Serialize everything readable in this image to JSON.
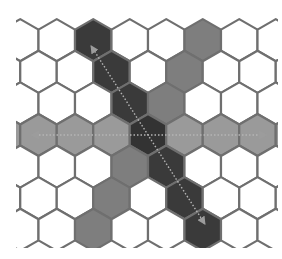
{
  "diagram": {
    "grid": {
      "orientation": "pointy-top",
      "rows": [
        -3,
        -2,
        -1,
        0,
        1,
        2,
        3
      ],
      "q_range": [
        -6,
        6
      ]
    },
    "center_cell": {
      "q": 0,
      "r": 0
    },
    "axes": [
      {
        "name": "horizontal-axis",
        "type": "row",
        "fill": "#9a9a9a",
        "arrow": "double-headed-dotted"
      },
      {
        "name": "diagonal-axis-up-right",
        "type": "q-constant",
        "fill": "#3a3a3a",
        "arrow": "double-headed-dotted"
      },
      {
        "name": "diagonal-axis-down-right",
        "type": "s-constant",
        "fill": "#7e7e7e",
        "arrow": "none"
      }
    ],
    "colors": {
      "background": "#ffffff",
      "empty_cell": "#ffffff",
      "cell_stroke": "#6f6f6f",
      "horizontal_fill": "#9a9a9a",
      "dark_diagonal_fill": "#3a3a3a",
      "gray_diagonal_fill": "#7e7e7e",
      "center_fill": "#333333",
      "arrow_color": "#b5b5b5"
    }
  }
}
